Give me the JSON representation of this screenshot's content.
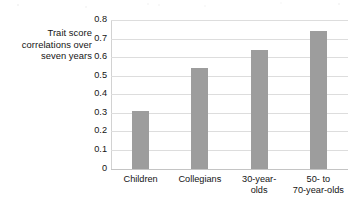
{
  "chart_data": {
    "type": "bar",
    "title": "",
    "subtitle": "",
    "xlabel": "",
    "ylabel": "Trait score correlations over seven years",
    "ylabel_lines": [
      "Trait score",
      "correlations over",
      "seven years"
    ],
    "categories": [
      "Children",
      "Collegians",
      "30-year-olds",
      "50- to 70-year-olds"
    ],
    "category_label_lines": [
      [
        "Children"
      ],
      [
        "Collegians"
      ],
      [
        "30-year-",
        "olds"
      ],
      [
        "50-  to",
        "70-year-olds"
      ]
    ],
    "values": [
      0.31,
      0.54,
      0.64,
      0.74
    ],
    "ylim": [
      0,
      0.8
    ],
    "ytick_values": [
      0,
      0.1,
      0.2,
      0.3,
      0.4,
      0.5,
      0.6,
      0.7,
      0.8
    ],
    "ytick_labels": [
      "0",
      "0.1",
      "0.2",
      "0.3",
      "0.4",
      "0.5",
      "0.6",
      "0.7",
      "0.8"
    ],
    "grid": true,
    "grid_axis": "y",
    "legend": false,
    "legend_position": "none",
    "bar_color": "#9d9d9d",
    "gridline_color": "#dddddd",
    "axis_color": "#c4c4c4",
    "text_color": "#141414",
    "background_color": "#ffffff"
  }
}
